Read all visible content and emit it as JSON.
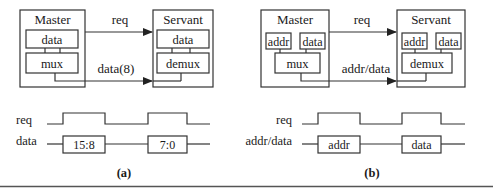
{
  "figure": {
    "panel_a": {
      "caption": "(a)",
      "master": {
        "title": "Master",
        "blocks": [
          "data",
          "mux"
        ]
      },
      "servant": {
        "title": "Servant",
        "blocks": [
          "data",
          "demux"
        ]
      },
      "signals": {
        "req": "req",
        "data": "data(8)"
      },
      "timing": {
        "rows": [
          "req",
          "data"
        ],
        "data_segments": [
          "15:8",
          "7:0"
        ]
      }
    },
    "panel_b": {
      "caption": "(b)",
      "master": {
        "title": "Master",
        "blocks": [
          "addr",
          "data",
          "mux"
        ]
      },
      "servant": {
        "title": "Servant",
        "blocks": [
          "addr",
          "data",
          "demux"
        ]
      },
      "signals": {
        "req": "req",
        "bus": "addr/data"
      },
      "timing": {
        "rows": [
          "req",
          "addr/data"
        ],
        "data_segments": [
          "addr",
          "data"
        ]
      }
    }
  }
}
